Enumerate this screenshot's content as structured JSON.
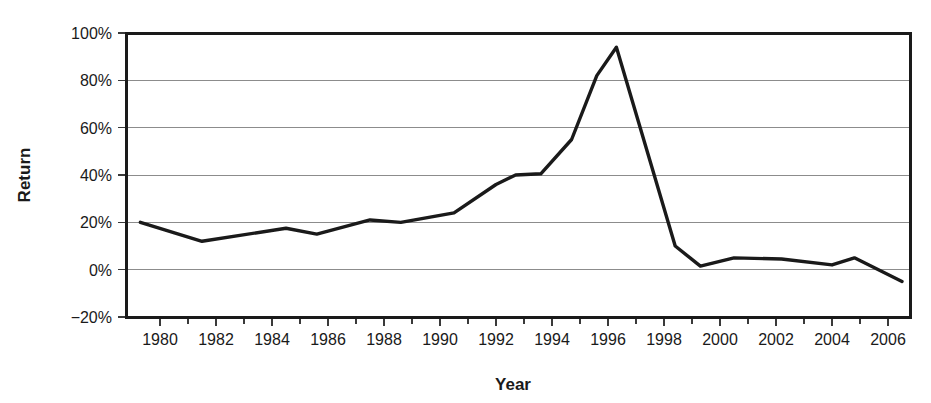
{
  "chart_data": {
    "type": "line",
    "title": "",
    "xlabel": "Year",
    "ylabel": "Return",
    "xlim": [
      1979.0,
      1907.0
    ],
    "ylim": [
      -20,
      100
    ],
    "grid": true,
    "legend": "none",
    "y_tick_labels": [
      "100%",
      "80%",
      "60%",
      "40%",
      "20%",
      "0%",
      "−20%"
    ],
    "y_tick_values": [
      100,
      80,
      60,
      40,
      20,
      0,
      -20
    ],
    "x_tick_labels": [
      "1980",
      "1982",
      "1984",
      "1986",
      "1988",
      "1990",
      "1992",
      "1994",
      "1996",
      "1998",
      "2000",
      "2002",
      "2004",
      "2006"
    ],
    "x_tick_values": [
      1980,
      1982,
      1984,
      1986,
      1988,
      1990,
      1992,
      1994,
      1996,
      1998,
      2000,
      2002,
      2004,
      2006
    ],
    "x_minor_tick_values": [
      1981,
      1983,
      1985,
      1987,
      1989,
      1991,
      1993,
      1995,
      1997,
      1999,
      2001,
      2003,
      2005
    ],
    "series": [
      {
        "name": "Return",
        "color": "#1a1a1a",
        "x": [
          1979.3,
          1981.5,
          1984.5,
          1985.6,
          1987.5,
          1988.6,
          1990.5,
          1992.0,
          1992.7,
          1993.6,
          1994.7,
          1995.6,
          1996.3,
          1998.4,
          1999.3,
          2000.5,
          2002.2,
          2004.0,
          2004.8,
          2006.5
        ],
        "values": [
          20.0,
          12.0,
          17.5,
          15.0,
          21.0,
          20.0,
          24.0,
          36.0,
          40.0,
          40.5,
          55.0,
          82.0,
          94.0,
          10.0,
          1.5,
          5.0,
          4.5,
          2.0,
          5.0,
          -5.0
        ]
      }
    ],
    "annotations": []
  },
  "axes": {
    "y_axis_title": "Return",
    "x_axis_title": "Year"
  },
  "colors": {
    "line": "#1a1a1a",
    "grid": "#8c8c8c",
    "frame": "#1a1a1a",
    "background": "#ffffff",
    "text": "#1a1a1a"
  }
}
